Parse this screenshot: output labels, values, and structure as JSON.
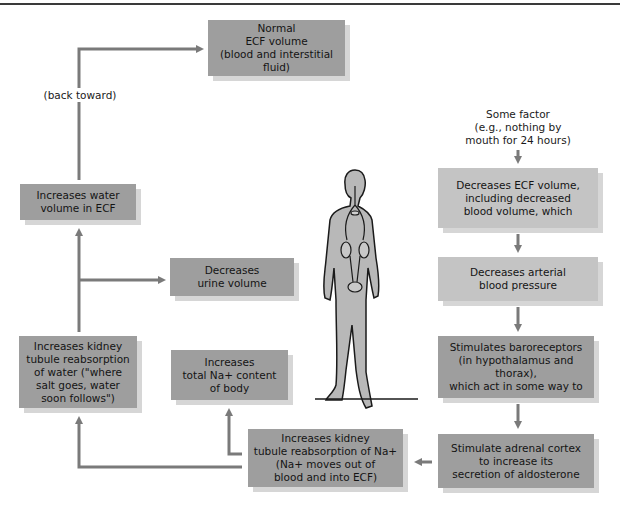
{
  "diagram": {
    "title": "",
    "colors": {
      "box_dark": "#9e9e9e",
      "box_light": "#c4c4c4",
      "arrow": "#7a7a7a",
      "figure": "#b8b8b8"
    },
    "start_label": "Some factor\n(e.g., nothing by\nmouth for 24 hours)",
    "loop_label": "(back toward)",
    "boxes": {
      "normal_ecf": "Normal\nECF volume\n(blood and interstitial fluid)",
      "decreases_ecf": "Decreases ECF volume,\nincluding decreased\nblood volume, which",
      "decreases_bp": "Decreases arterial\nblood pressure",
      "baroreceptors": "Stimulates baroreceptors\n(in hypothalamus and thorax),\nwhich act in some way to",
      "adrenal": "Stimulate adrenal cortex\nto increase its\nsecretion of aldosterone",
      "na_reabsorption": "Increases kidney\ntubule reabsorption of Na+\n(Na+ moves out of\nblood and into ECF)",
      "total_na": "Increases\ntotal Na+ content\nof body",
      "water_reabsorption": "Increases kidney\ntubule reabsorption\nof water (\"where\nsalt goes, water\nsoon follows\")",
      "urine": "Decreases\nurine volume",
      "water_volume": "Increases water\nvolume in ECF"
    },
    "figure": "human-body-with-kidneys-icon"
  }
}
